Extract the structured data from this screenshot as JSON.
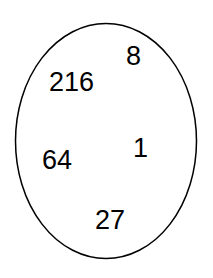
{
  "figure": {
    "type": "set-diagram",
    "background_color": "#ffffff",
    "width": 213,
    "height": 278
  },
  "set_region": {
    "shape": "ellipse",
    "label": "set-boundary",
    "stroke_color": "#000000",
    "fill_color": "none",
    "stroke_width": 1.5,
    "center_x": 106,
    "center_y": 141,
    "radius_x": 90.5,
    "radius_y": 117.5
  },
  "members": [
    {
      "id": "8",
      "value": "8",
      "x": 126,
      "y": 43,
      "color": "#000000",
      "font_size": 27
    },
    {
      "id": "216",
      "value": "216",
      "x": 49,
      "y": 69,
      "color": "#000000",
      "font_size": 27
    },
    {
      "id": "1",
      "value": "1",
      "x": 133,
      "y": 135,
      "color": "#000000",
      "font_size": 27
    },
    {
      "id": "64",
      "value": "64",
      "x": 42,
      "y": 147,
      "color": "#000000",
      "font_size": 27
    },
    {
      "id": "27",
      "value": "27",
      "x": 95,
      "y": 207,
      "color": "#000000",
      "font_size": 27
    }
  ]
}
